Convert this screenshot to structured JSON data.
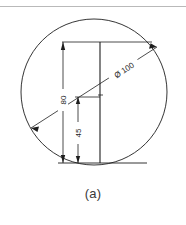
{
  "figure": {
    "caption": "(a)",
    "type": "engineering-drawing",
    "colors": {
      "line": "#1e1e1e",
      "rule": "#b9b9b9",
      "background": "#ffffff",
      "caption_text": "#3a3a3a"
    },
    "circle": {
      "label": "Ø 100",
      "diameter_value": "100",
      "diameter_symbol": "Ø",
      "center_x": 94,
      "center_y": 92,
      "radius": 73
    },
    "dimensions": [
      {
        "name": "height-80",
        "label": "80",
        "orientation": "vertical",
        "x": 63,
        "y_top": 42,
        "y_bottom": 163
      },
      {
        "name": "height-45",
        "label": "45",
        "orientation": "vertical",
        "x": 78,
        "y_top": 97,
        "y_bottom": 163
      }
    ],
    "leader": {
      "name": "diameter-leader",
      "x1": 31,
      "y1": 128,
      "x2": 157,
      "y2": 47,
      "label": "Ø 100"
    },
    "centerline": {
      "x": 100,
      "y_top": 42,
      "y_bottom": 163
    }
  }
}
